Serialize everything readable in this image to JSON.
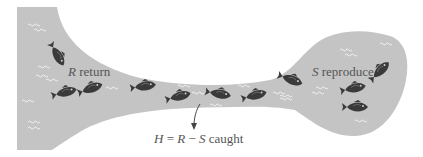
{
  "diagram": {
    "labels": {
      "return": {
        "symbol": "R",
        "text": "return"
      },
      "reproduce": {
        "symbol": "S",
        "text": "reproduce"
      },
      "caught": {
        "h": "H",
        "eq": "=",
        "r": "R",
        "minus": "−",
        "s": "S",
        "text": "caught"
      }
    },
    "colors": {
      "water": "#c4c4c4",
      "fish": "#3a3a3a",
      "ripple": "#f2f2f2",
      "text": "#555555"
    }
  }
}
